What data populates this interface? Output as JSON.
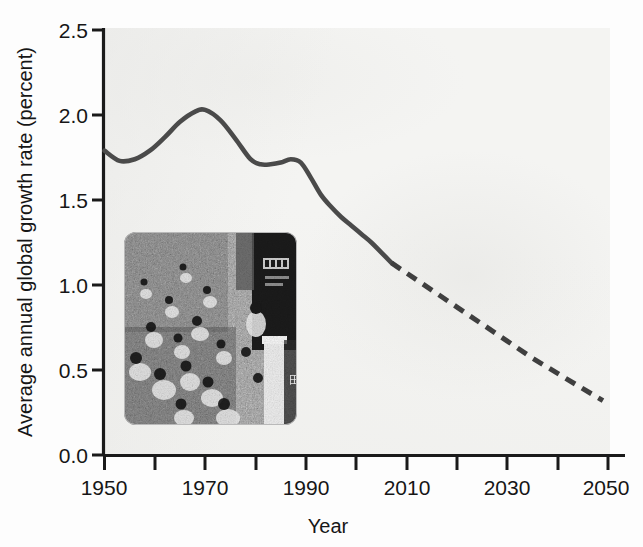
{
  "chart_data": {
    "type": "line",
    "title": "",
    "subtitle": "",
    "xlabel": "Year",
    "ylabel": "Average annual global growth rate (percent)",
    "xlim": [
      1950,
      2050
    ],
    "ylim": [
      0.0,
      2.5
    ],
    "grid": false,
    "legend_position": "none",
    "x_ticks_major": [
      1950,
      1970,
      1990,
      2010,
      2030,
      2050
    ],
    "x_tick_labels": [
      "1950",
      "1970",
      "1990",
      "2010",
      "2030",
      "2050"
    ],
    "x_ticks_minor": [
      1960,
      1980,
      2000,
      2020,
      2040
    ],
    "y_ticks": [
      0.0,
      0.5,
      1.0,
      1.5,
      2.0,
      2.5
    ],
    "y_tick_labels": [
      "0.0",
      "0.5",
      "1.0",
      "1.5",
      "2.0",
      "2.5"
    ],
    "series": [
      {
        "name": "Estimated average annual global growth rate",
        "style": "solid",
        "color": "#4a4a4a",
        "x": [
          1950,
          1953,
          1956,
          1959,
          1962,
          1965,
          1968,
          1970,
          1973,
          1976,
          1979,
          1981,
          1983,
          1985,
          1987,
          1989,
          1991,
          1993,
          1995,
          1997,
          1999,
          2001,
          2003,
          2005,
          2007
        ],
        "values": [
          1.79,
          1.73,
          1.74,
          1.79,
          1.87,
          1.96,
          2.02,
          2.03,
          1.97,
          1.86,
          1.74,
          1.71,
          1.71,
          1.72,
          1.74,
          1.72,
          1.63,
          1.53,
          1.46,
          1.4,
          1.35,
          1.3,
          1.25,
          1.19,
          1.13
        ]
      },
      {
        "name": "Projected average annual global growth rate",
        "style": "dashed",
        "color": "#3f3f3f",
        "x": [
          2007,
          2010,
          2015,
          2020,
          2025,
          2030,
          2035,
          2040,
          2045,
          2049
        ],
        "values": [
          1.13,
          1.07,
          0.97,
          0.87,
          0.77,
          0.67,
          0.57,
          0.48,
          0.39,
          0.32
        ]
      }
    ],
    "annotations": [
      {
        "type": "inset-image",
        "name": "crowd-photo",
        "description": "Black and white photograph of a dense crowd of people filling a street beside a dark building facade with signage"
      }
    ]
  },
  "axes": {
    "y_axis_title": "Average annual global growth rate (percent)",
    "x_axis_title": "Year"
  }
}
